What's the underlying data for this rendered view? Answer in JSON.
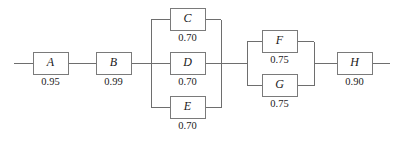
{
  "diagram": {
    "type": "reliability-block-diagram",
    "title": "",
    "background_color": "#ffffff",
    "line_color": "#6e6e6e",
    "box_fill_color": "#ffffff",
    "box_border_color": "#7a7a7a",
    "text_color": "#1a1a1a",
    "main_line_y": 63,
    "blocks": [
      {
        "id": "A",
        "label": "A",
        "value": "0.95",
        "x": 33,
        "y": 52,
        "w": 35,
        "h": 22,
        "value_y": 83
      },
      {
        "id": "B",
        "label": "B",
        "value": "0.99",
        "x": 96,
        "y": 52,
        "w": 35,
        "h": 22,
        "value_y": 83
      },
      {
        "id": "C",
        "label": "C",
        "value": "0.70",
        "x": 170,
        "y": 8,
        "w": 35,
        "h": 22,
        "value_y": 39
      },
      {
        "id": "D",
        "label": "D",
        "value": "0.70",
        "x": 170,
        "y": 52,
        "w": 35,
        "h": 22,
        "value_y": 83
      },
      {
        "id": "E",
        "label": "E",
        "value": "0.70",
        "x": 170,
        "y": 96,
        "w": 35,
        "h": 22,
        "value_y": 127
      },
      {
        "id": "F",
        "label": "F",
        "value": "0.75",
        "x": 262,
        "y": 30,
        "w": 35,
        "h": 22,
        "value_y": 61
      },
      {
        "id": "G",
        "label": "G",
        "value": "0.75",
        "x": 262,
        "y": 74,
        "w": 35,
        "h": 22,
        "value_y": 105
      },
      {
        "id": "H",
        "label": "H",
        "value": "0.90",
        "x": 337,
        "y": 52,
        "w": 35,
        "h": 22,
        "value_y": 83
      }
    ],
    "parallel_groups": [
      {
        "id": "cde",
        "members": [
          "C",
          "D",
          "E"
        ],
        "left_bus_x": 151,
        "right_bus_x": 221,
        "bus_top_y": 19,
        "bus_bottom_y": 107
      },
      {
        "id": "fg",
        "members": [
          "F",
          "G"
        ],
        "left_bus_x": 247,
        "right_bus_x": 314,
        "bus_top_y": 41,
        "bus_bottom_y": 85
      }
    ],
    "terminals": {
      "left_stub_start_x": 14,
      "right_stub_end_x": 390
    },
    "wires": [
      {
        "name": "input-stub",
        "d": "M14 63 H33"
      },
      {
        "name": "wire-a-to-b",
        "d": "M68 63 H96"
      },
      {
        "name": "wire-b-to-cde-bus",
        "d": "M131 63 H151"
      },
      {
        "name": "cde-left-bus",
        "d": "M151.5 19.5 V107.5"
      },
      {
        "name": "cde-branch-to-c",
        "d": "M151 19.5 H170"
      },
      {
        "name": "cde-branch-to-d",
        "d": "M151 63 H170"
      },
      {
        "name": "cde-branch-to-e",
        "d": "M151 107.5 H170"
      },
      {
        "name": "cde-branch-from-c",
        "d": "M205 19.5 H221"
      },
      {
        "name": "cde-branch-from-d",
        "d": "M205 63 H221"
      },
      {
        "name": "cde-branch-from-e",
        "d": "M205 107.5 H221"
      },
      {
        "name": "cde-right-bus",
        "d": "M221.5 19.5 V107.5"
      },
      {
        "name": "wire-cde-to-fg-bus",
        "d": "M221 63 H247"
      },
      {
        "name": "fg-left-bus",
        "d": "M247.5 41.5 V85.5"
      },
      {
        "name": "fg-branch-to-f",
        "d": "M247 41.5 H262"
      },
      {
        "name": "fg-branch-to-g",
        "d": "M247 85.5 H262"
      },
      {
        "name": "fg-branch-from-f",
        "d": "M297 41.5 H314"
      },
      {
        "name": "fg-branch-from-g",
        "d": "M297 85.5 H314"
      },
      {
        "name": "fg-right-bus",
        "d": "M314.5 41.5 V85.5"
      },
      {
        "name": "wire-fg-to-h",
        "d": "M314 63 H337"
      },
      {
        "name": "output-stub",
        "d": "M372 63 H390"
      }
    ]
  }
}
